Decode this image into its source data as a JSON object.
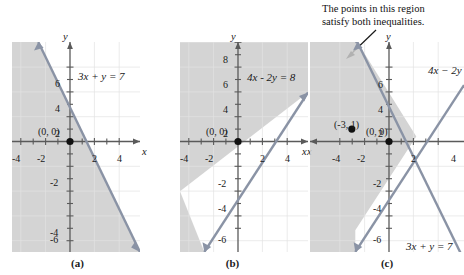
{
  "figure": {
    "background_color": "#ffffff",
    "shade_color": "#cccccc",
    "line_color": "#8a93a5",
    "axis_color": "#5a5a5a",
    "grid_color": "#e2e2e2",
    "point_color": "#111111"
  },
  "panels": [
    {
      "id": "a",
      "label": "(a)",
      "equation_label": "3x + y = 7",
      "axis_x_name": "x",
      "axis_y_name": "y",
      "x_ticks": [
        "-4",
        "-2",
        "2",
        "4"
      ],
      "y_ticks": [
        "6",
        "4",
        "2",
        "-2",
        "-4",
        "-6"
      ],
      "origin_label": "(0, 0)",
      "test_points": [
        {
          "label": "(0, 0)",
          "x": 0,
          "y": 0
        }
      ],
      "lines": [
        {
          "equation": "3x + y = 7",
          "slope": -3,
          "intercept": 7
        }
      ],
      "shaded_side": "left-below",
      "x_range": [
        -5.5,
        5.5
      ],
      "y_range": [
        -7.2,
        8.6
      ]
    },
    {
      "id": "b",
      "label": "(b)",
      "equation_label": "4x - 2y = 8",
      "axis_x_name": "x",
      "axis_y_name": "y",
      "x_ticks": [
        "-4",
        "-2",
        "2",
        "4"
      ],
      "y_ticks": [
        "8",
        "6",
        "4",
        "2",
        "-2",
        "-4",
        "-6"
      ],
      "origin_label": "(0, 0)",
      "test_points": [
        {
          "label": "(0, 0)",
          "x": 0,
          "y": 0
        }
      ],
      "lines": [
        {
          "equation": "4x - 2y = 8",
          "slope": 2,
          "intercept": -4
        }
      ],
      "shaded_side": "above-left",
      "x_range": [
        -5.5,
        5.5
      ],
      "y_range": [
        -7.2,
        8.6
      ]
    },
    {
      "id": "c",
      "label": "(c)",
      "annotation": "The points in this region\nsatisfy both inequalities.",
      "equation_label_upper": "4x − 2y",
      "equation_label_lower": "3x + y = 7",
      "axis_x_name": "x",
      "axis_y_name": "y",
      "x_ticks": [
        "-4",
        "-2",
        "2",
        "4"
      ],
      "y_ticks": [
        "6",
        "4",
        "2",
        "-2",
        "-4",
        "-6"
      ],
      "origin_label": "(0, 0)",
      "test_points": [
        {
          "label": "(-3, 1)",
          "x": -3,
          "y": 1
        },
        {
          "label": "(0, 0)",
          "x": 0,
          "y": 0
        }
      ],
      "lines": [
        {
          "equation": "3x + y = 7",
          "slope": -3,
          "intercept": 7
        },
        {
          "equation": "4x - 2y = 8",
          "slope": 2,
          "intercept": -4
        }
      ],
      "shaded_side": "intersection",
      "x_range": [
        -5.5,
        5.5
      ],
      "y_range": [
        -7.2,
        8.6
      ]
    }
  ]
}
